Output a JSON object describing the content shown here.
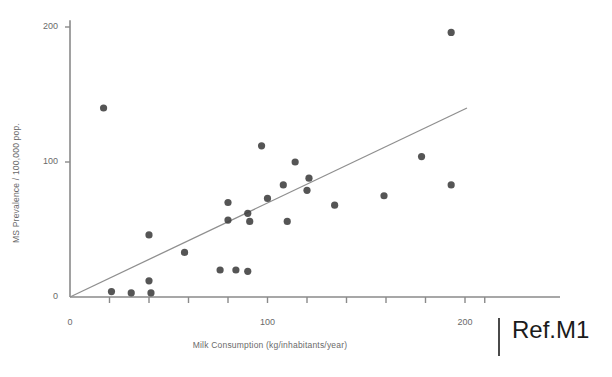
{
  "figure": {
    "ref_note": "Ref.M1"
  },
  "chart_data": {
    "type": "scatter",
    "title": "",
    "xlabel": "Milk Consumption (kg/inhabitants/year)",
    "ylabel": "MS Prevalence / 100,000 pop.",
    "xlim": [
      0,
      215
    ],
    "ylim": [
      0,
      210
    ],
    "xticks": [
      0,
      100,
      200
    ],
    "xtick_labels": [
      "0",
      "100",
      "200"
    ],
    "xticks_minor": [
      20,
      40,
      60,
      80,
      120,
      140,
      160,
      180
    ],
    "yticks": [
      0,
      100,
      200
    ],
    "ytick_labels": [
      "0",
      "100",
      "200"
    ],
    "grid": false,
    "legend": null,
    "marker_color": "#3d3d3d",
    "axis_color": "#8a8a8a",
    "line_color": "#8f8f8f",
    "points": [
      {
        "x": 17,
        "y": 140
      },
      {
        "x": 21,
        "y": 4
      },
      {
        "x": 31,
        "y": 3
      },
      {
        "x": 40,
        "y": 46
      },
      {
        "x": 40,
        "y": 12
      },
      {
        "x": 41,
        "y": 3
      },
      {
        "x": 58,
        "y": 33
      },
      {
        "x": 76,
        "y": 20
      },
      {
        "x": 80,
        "y": 70
      },
      {
        "x": 80,
        "y": 57
      },
      {
        "x": 84,
        "y": 20
      },
      {
        "x": 90,
        "y": 19
      },
      {
        "x": 90,
        "y": 62
      },
      {
        "x": 91,
        "y": 56
      },
      {
        "x": 97,
        "y": 112
      },
      {
        "x": 100,
        "y": 73
      },
      {
        "x": 108,
        "y": 83
      },
      {
        "x": 110,
        "y": 56
      },
      {
        "x": 114,
        "y": 100
      },
      {
        "x": 120,
        "y": 79
      },
      {
        "x": 121,
        "y": 88
      },
      {
        "x": 134,
        "y": 68
      },
      {
        "x": 159,
        "y": 75
      },
      {
        "x": 178,
        "y": 104
      },
      {
        "x": 193,
        "y": 196
      },
      {
        "x": 193,
        "y": 83
      }
    ],
    "trend_line": {
      "x0": 0,
      "y0": 0,
      "x1": 201,
      "y1": 140
    }
  }
}
